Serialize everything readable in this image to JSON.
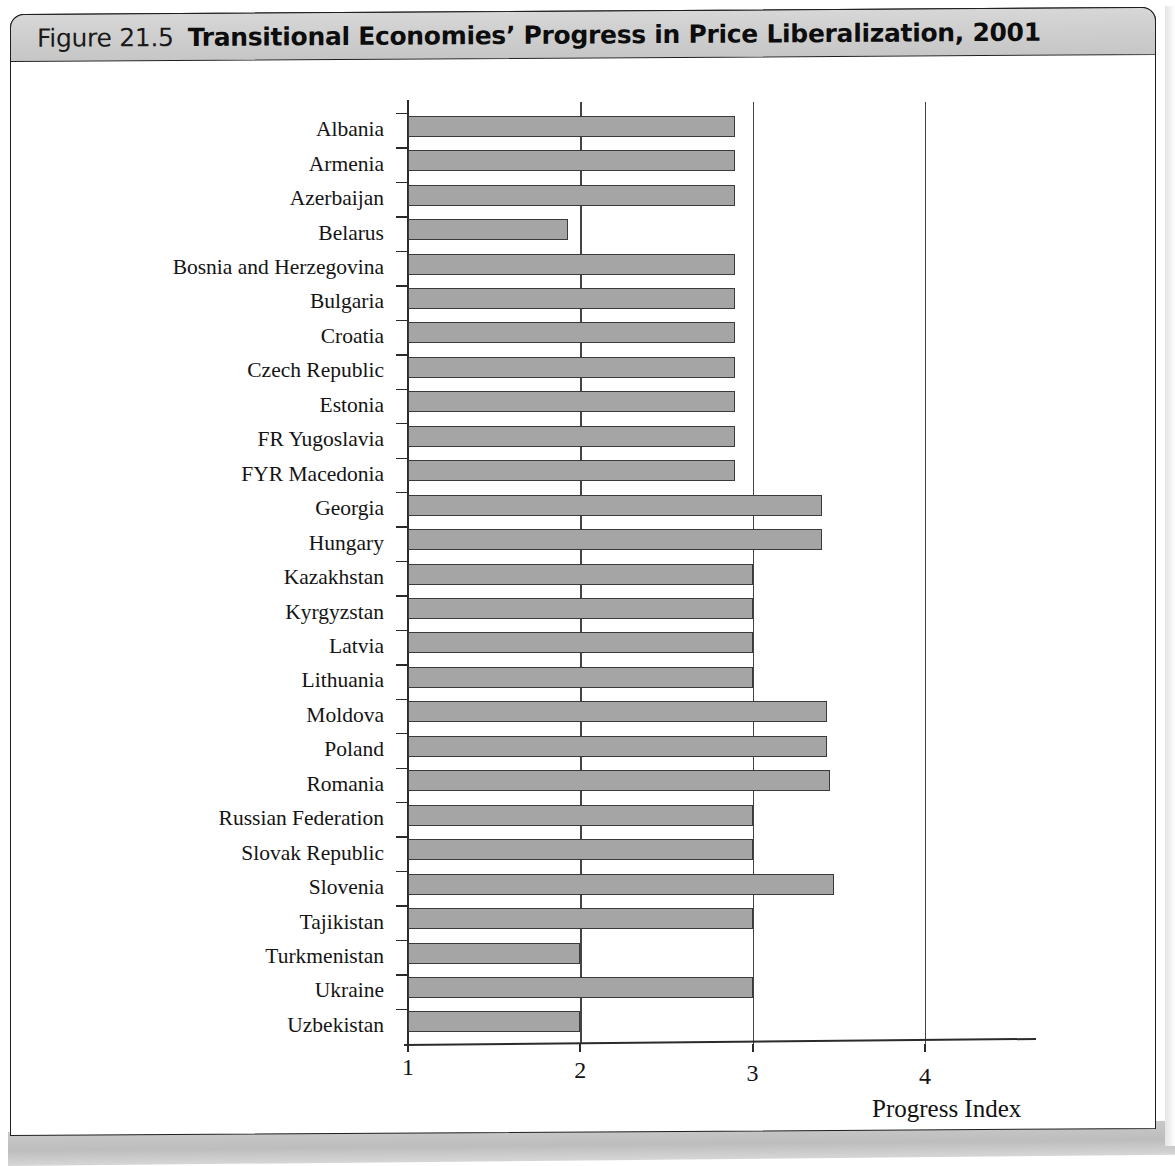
{
  "figure": {
    "number_label": "Figure 21.5",
    "title": "Transitional Economies’ Progress in Price Liberalization, 2001"
  },
  "colors": {
    "bar_fill": "#a5a5a5",
    "bar_stroke": "#3a3a3a",
    "axis": "#2b2b2b",
    "title_bar": "#cfcfcf",
    "page_background": "#ffffff"
  },
  "chart_data": {
    "type": "bar",
    "orientation": "horizontal",
    "title": "Transitional Economies’ Progress in Price Liberalization, 2001",
    "xlabel": "Progress Index",
    "ylabel": "",
    "xlim": [
      1,
      4.35
    ],
    "xticks": [
      1,
      2,
      3,
      4
    ],
    "xtick_labels": [
      "1",
      "2",
      "3",
      "4"
    ],
    "grid": "vertical gridlines at 2, 3 and 4",
    "legend": "none",
    "categories": [
      "Albania",
      "Armenia",
      "Azerbaijan",
      "Belarus",
      "Bosnia and Herzegovina",
      "Bulgaria",
      "Croatia",
      "Czech Republic",
      "Estonia",
      "FR Yugoslavia",
      "FYR Macedonia",
      "Georgia",
      "Hungary",
      "Kazakhstan",
      "Kyrgyzstan",
      "Latvia",
      "Lithuania",
      "Moldova",
      "Poland",
      "Romania",
      "Russian Federation",
      "Slovak Republic",
      "Slovenia",
      "Tajikistan",
      "Turkmenistan",
      "Ukraine",
      "Uzbekistan"
    ],
    "values": [
      2.9,
      2.9,
      2.9,
      1.93,
      2.9,
      2.9,
      2.9,
      2.9,
      2.9,
      2.9,
      2.9,
      3.4,
      3.4,
      3.0,
      3.0,
      3.0,
      3.0,
      3.43,
      3.43,
      3.45,
      3.0,
      3.0,
      3.47,
      3.0,
      2.0,
      3.0,
      2.0
    ]
  }
}
